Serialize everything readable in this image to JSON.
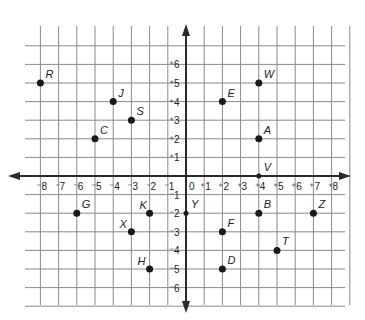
{
  "axes": {
    "x_ticks": [
      "-8",
      "-7",
      "-6",
      "-5",
      "-4",
      "-3",
      "-2",
      "-1",
      "0",
      "+1",
      "+2",
      "+3",
      "+4",
      "+5",
      "+6",
      "+7",
      "+8"
    ],
    "y_ticks_positive": [
      "+6",
      "+5",
      "+4",
      "+3",
      "+2",
      "+1"
    ],
    "y_ticks_negative": [
      "-1",
      "-2",
      "-3",
      "-4",
      "-5",
      "-6"
    ],
    "origin_label": "0"
  },
  "points": [
    {
      "label": "R",
      "x": -8,
      "y": 5
    },
    {
      "label": "J",
      "x": -4,
      "y": 4
    },
    {
      "label": "S",
      "x": -3,
      "y": 3
    },
    {
      "label": "C",
      "x": -5,
      "y": 2
    },
    {
      "label": "E",
      "x": 2,
      "y": 4
    },
    {
      "label": "W",
      "x": 4,
      "y": 5
    },
    {
      "label": "A",
      "x": 4,
      "y": 2
    },
    {
      "label": "V",
      "x": 4,
      "y": 0
    },
    {
      "label": "G",
      "x": -6,
      "y": -2
    },
    {
      "label": "K",
      "x": -2,
      "y": -2
    },
    {
      "label": "X",
      "x": -3,
      "y": -3
    },
    {
      "label": "H",
      "x": -2,
      "y": -5
    },
    {
      "label": "Y",
      "x": 0,
      "y": -2
    },
    {
      "label": "B",
      "x": 4,
      "y": -2
    },
    {
      "label": "Z",
      "x": 7,
      "y": -2
    },
    {
      "label": "F",
      "x": 2,
      "y": -3
    },
    {
      "label": "T",
      "x": 5,
      "y": -4
    },
    {
      "label": "D",
      "x": 2,
      "y": -5
    }
  ],
  "chart_data": {
    "type": "scatter",
    "title": "",
    "xlabel": "",
    "ylabel": "",
    "xlim": [
      -8,
      8
    ],
    "ylim": [
      -6,
      6
    ],
    "grid": true,
    "series": [
      {
        "name": "points",
        "labels": [
          "R",
          "J",
          "S",
          "C",
          "E",
          "W",
          "A",
          "V",
          "G",
          "K",
          "X",
          "H",
          "Y",
          "B",
          "Z",
          "F",
          "T",
          "D"
        ],
        "x": [
          -8,
          -4,
          -3,
          -5,
          2,
          4,
          4,
          4,
          -6,
          -2,
          -3,
          -2,
          0,
          4,
          7,
          2,
          5,
          2
        ],
        "y": [
          5,
          4,
          3,
          2,
          4,
          5,
          2,
          0,
          -2,
          -2,
          -3,
          -5,
          -2,
          -2,
          -2,
          -3,
          -4,
          -5
        ]
      }
    ]
  }
}
